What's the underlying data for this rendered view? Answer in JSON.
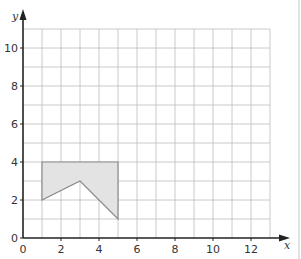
{
  "chart_data": {
    "type": "scatter",
    "title": "",
    "xlabel": "x",
    "ylabel": "y",
    "xlim": [
      0,
      13
    ],
    "ylim": [
      0,
      11
    ],
    "x_ticks": [
      0,
      2,
      4,
      6,
      8,
      10,
      12
    ],
    "y_ticks": [
      0,
      2,
      4,
      6,
      8,
      10
    ],
    "grid": true,
    "grid_step": 1,
    "legend": null,
    "shapes": [
      {
        "name": "shaded-polygon",
        "fill": "#e3e3e3",
        "stroke": "#8a8a8a",
        "vertices": [
          [
            1,
            4
          ],
          [
            5,
            4
          ],
          [
            5,
            1
          ],
          [
            3,
            3
          ],
          [
            1,
            2
          ]
        ]
      }
    ]
  },
  "colors": {
    "grid": "#bdbdbd",
    "axis": "#222222",
    "shape_fill": "#e3e3e3",
    "shape_stroke": "#8a8a8a"
  }
}
